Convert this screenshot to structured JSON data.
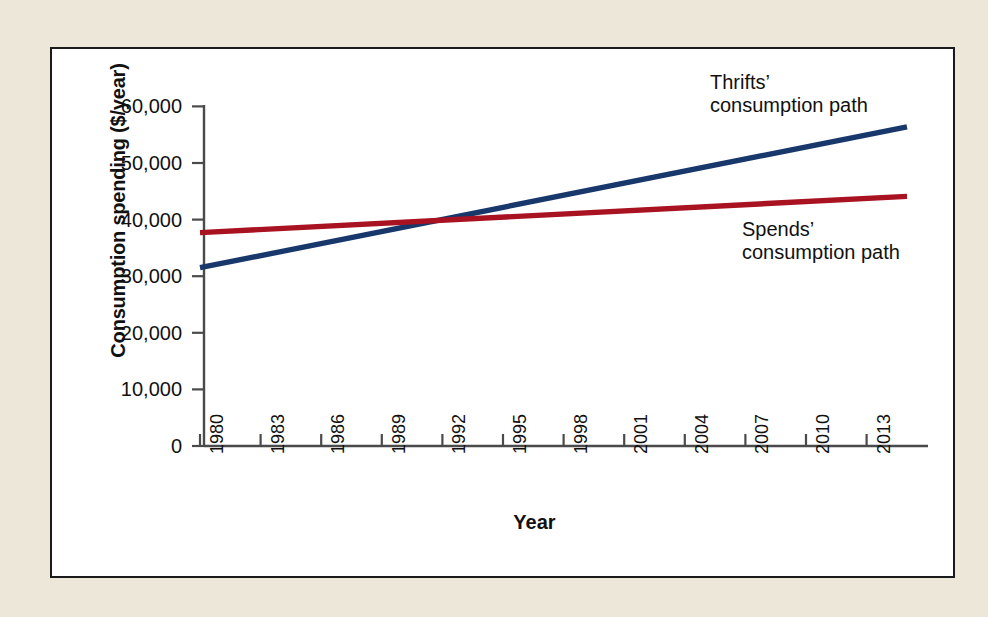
{
  "figure": {
    "background_color": "#ece7d8",
    "panel_color": "#ffffff",
    "border_color": "#1a1a1a"
  },
  "chart_data": {
    "type": "line",
    "title": "",
    "xlabel": "Year",
    "ylabel": "Consumption spending ($/year)",
    "xlim": [
      1980,
      2015
    ],
    "ylim": [
      0,
      62000
    ],
    "grid": false,
    "legend_position": "inline-annotations",
    "x_ticks": [
      "1980",
      "1983",
      "1986",
      "1989",
      "1992",
      "1995",
      "1998",
      "2001",
      "2004",
      "2007",
      "2010",
      "2013"
    ],
    "x_tick_values": [
      1980,
      1983,
      1986,
      1989,
      1992,
      1995,
      1998,
      2001,
      2004,
      2007,
      2010,
      2013
    ],
    "y_ticks": [
      "0",
      "10,000",
      "20,000",
      "30,000",
      "40,000",
      "50,000",
      "60,000"
    ],
    "y_tick_values": [
      0,
      10000,
      20000,
      30000,
      40000,
      50000,
      60000
    ],
    "series": [
      {
        "name": "Thrifts' consumption path",
        "color": "#18386b",
        "annotation": "Thrifts’\nconsumption path",
        "x": [
          1980,
          2015
        ],
        "values": [
          31500,
          56400
        ]
      },
      {
        "name": "Spends' consumption path",
        "color": "#a81221",
        "annotation": "Spends’\nconsumption path",
        "x": [
          1980,
          2015
        ],
        "values": [
          37700,
          44100
        ]
      }
    ],
    "crossing_point": {
      "x": 1994.5,
      "y": 40500
    }
  }
}
